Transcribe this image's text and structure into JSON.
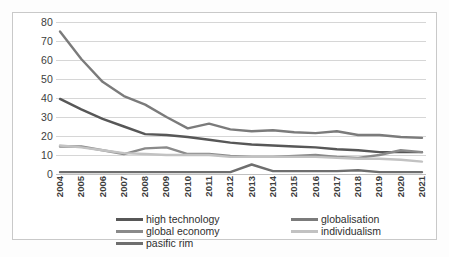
{
  "chart_data": {
    "type": "line",
    "title": "",
    "xlabel": "",
    "ylabel": "",
    "ylim": [
      0,
      80
    ],
    "yticks": [
      0,
      10,
      20,
      30,
      40,
      50,
      60,
      70,
      80
    ],
    "grid": true,
    "legend_position": "bottom",
    "categories": [
      "2004",
      "2005",
      "2006",
      "2007",
      "2008",
      "2009",
      "2010",
      "2011",
      "2012",
      "2013",
      "2014",
      "2015",
      "2016",
      "2017",
      "2018",
      "2019",
      "2020",
      "2021"
    ],
    "series": [
      {
        "name": "high technology",
        "color": "#575757",
        "values": [
          39.5,
          34.0,
          29.0,
          25.0,
          21.0,
          20.5,
          19.5,
          18.0,
          16.5,
          15.5,
          15.0,
          14.5,
          14.0,
          13.0,
          12.5,
          11.5,
          11.5,
          11.5
        ]
      },
      {
        "name": "globalisation",
        "color": "#7b7b7b",
        "values": [
          75.0,
          60.5,
          48.5,
          41.0,
          36.5,
          30.0,
          24.0,
          26.5,
          23.5,
          22.5,
          23.0,
          22.0,
          21.5,
          22.5,
          20.5,
          20.5,
          19.5,
          19.0
        ]
      },
      {
        "name": "global economy",
        "color": "#8a8a8a",
        "values": [
          14.5,
          14.5,
          12.5,
          10.5,
          13.5,
          14.0,
          10.5,
          10.5,
          9.5,
          9.0,
          9.0,
          9.5,
          10.0,
          9.0,
          8.5,
          10.0,
          12.5,
          11.5
        ]
      },
      {
        "name": "individualism",
        "color": "#c2c2c2",
        "values": [
          15.0,
          14.0,
          12.5,
          11.0,
          10.5,
          10.0,
          10.0,
          10.0,
          9.0,
          9.0,
          9.0,
          9.0,
          9.0,
          8.5,
          8.0,
          8.0,
          7.5,
          6.5
        ]
      },
      {
        "name": "pasific rim",
        "color": "#6e6e6e",
        "values": [
          1.0,
          1.0,
          1.0,
          1.0,
          1.0,
          1.0,
          1.0,
          1.0,
          1.0,
          5.0,
          1.5,
          1.5,
          1.5,
          1.5,
          2.0,
          1.0,
          1.0,
          1.0
        ]
      }
    ]
  },
  "legend": {
    "items": [
      {
        "label": "high technology"
      },
      {
        "label": "globalisation"
      },
      {
        "label": "global economy"
      },
      {
        "label": "individualism"
      },
      {
        "label": "pasific rim"
      }
    ]
  },
  "caption": {
    "text": ""
  }
}
